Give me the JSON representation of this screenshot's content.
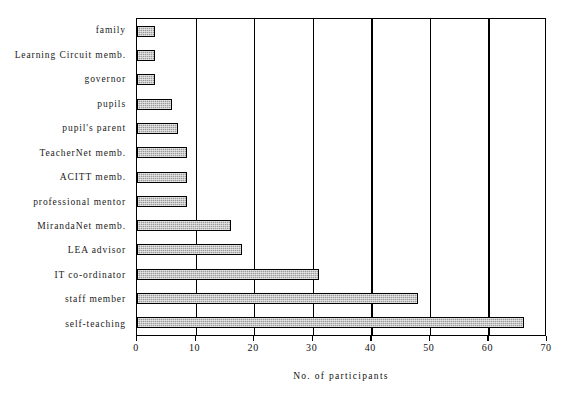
{
  "chart_data": {
    "type": "bar",
    "orientation": "horizontal",
    "title": "",
    "xlabel": "No. of participants",
    "ylabel": "",
    "xlim": [
      0,
      70
    ],
    "xticks": [
      0,
      10,
      20,
      30,
      40,
      50,
      60,
      70
    ],
    "grid": true,
    "legend": false,
    "categories": [
      "family",
      "Learning Circuit memb.",
      "governor",
      "pupils",
      "pupil's parent",
      "TeacherNet memb.",
      "ACITT memb.",
      "professional mentor",
      "MirandaNet memb.",
      "LEA advisor",
      "IT co-ordinator",
      "staff member",
      "self-teaching"
    ],
    "values": [
      3,
      3,
      3,
      6,
      7,
      8.5,
      8.5,
      8.5,
      16,
      18,
      31,
      48,
      66
    ],
    "bar_color": "#9b9b9b",
    "bar_border_color": "#000000",
    "axis_color": "#000000"
  }
}
